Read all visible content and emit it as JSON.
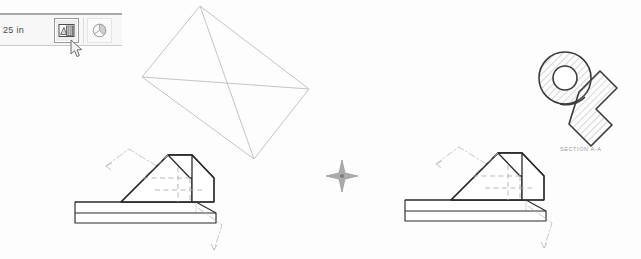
{
  "app": {
    "title": "CAD Drawing Canvas",
    "background_color": "#fdfdfd",
    "line_color": "#2b2b2b",
    "wireframe_color": "#b9b9b9",
    "hidden_line_color": "#b0b0b0",
    "leader_color": "#bcbcbc"
  },
  "toolbar": {
    "dimension_readout": "25 in",
    "buttons": [
      {
        "name": "render-shaded-button",
        "label": "",
        "icon": "shaded-render-icon",
        "selected": true
      },
      {
        "name": "section-view-button",
        "label": "",
        "icon": "pie-section-icon",
        "selected": false
      }
    ]
  },
  "cursor": {
    "icon": "mouse-pointer-icon",
    "x": 70,
    "y": 40
  },
  "canvas": {
    "wireframe_quad": {
      "name": "wireframe-quadrilateral",
      "color": "#b9b9b9",
      "vertices": [
        {
          "x": 200,
          "y": 6
        },
        {
          "x": 309,
          "y": 89
        },
        {
          "x": 254,
          "y": 159
        },
        {
          "x": 142,
          "y": 77
        }
      ],
      "diagonals": true
    },
    "center_marker": {
      "name": "center-crosshair-marker",
      "label": "",
      "x": 342,
      "y": 176,
      "color": "#9d9d9d"
    },
    "section_view": {
      "name": "hatched-section-view",
      "label": "SECTION A-A",
      "hatch_angle_deg": 45,
      "hatch_color": "#9e9e9e",
      "outline_color": "#3a3a3a"
    },
    "parts": [
      {
        "name": "wedge-on-slab-left",
        "label": "",
        "origin_x": 72,
        "leaders": 2,
        "hidden_lines": 4
      },
      {
        "name": "wedge-on-slab-right",
        "label": "",
        "origin_x": 402,
        "leaders": 2,
        "hidden_lines": 4
      }
    ]
  }
}
